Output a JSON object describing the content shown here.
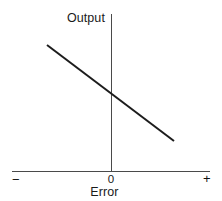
{
  "chart_data": {
    "type": "line",
    "title": "",
    "subtitle": "",
    "xlabel": "Error",
    "ylabel": "Output",
    "xlim": [
      -1,
      1
    ],
    "ylim": [
      -1,
      1
    ],
    "grid": false,
    "legend": null,
    "x_tick_labels": [
      "−",
      "0",
      "+"
    ],
    "x_tick_values": [
      -1,
      0,
      1
    ],
    "y_tick_labels": [],
    "y_tick_values": [],
    "annotations": [],
    "series": [
      {
        "name": "Output vs Error",
        "description": "Straight line with negative slope passing through the origin",
        "color": "#1c1c1c",
        "line_width": 2,
        "x": [
          -0.645,
          0.0,
          0.637
        ],
        "y": [
          0.624,
          0.0,
          -0.597
        ],
        "points_px": [
          [
            47,
            45
          ],
          [
            111,
            94
          ],
          [
            174,
            141
          ]
        ]
      }
    ],
    "axes": {
      "y_axis_color": "#4a4a4a",
      "x_axis_color": "#4a4a4a",
      "origin_px": [
        111,
        171
      ],
      "y_axis_px": {
        "x": 111,
        "y_top": 14,
        "y_bottom": 171
      },
      "x_axis_px": {
        "y": 171,
        "x_left": 12,
        "x_right": 210
      }
    }
  },
  "labels": {
    "y_axis_title": "Output",
    "x_axis_title": "Error",
    "tick_zero": "0",
    "tick_negative": "−",
    "tick_positive": "+"
  },
  "colors": {
    "background": "#ffffff",
    "line": "#1c1c1c",
    "axis": "#4a4a4a",
    "text": "#1a1a1a"
  }
}
